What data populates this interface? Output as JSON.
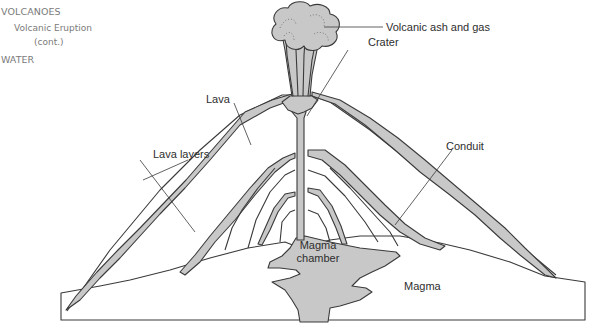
{
  "sidebar": {
    "section": "VOLCANOES",
    "subsection_line1": "Volcanic Eruption",
    "subsection_line2": "(cont.)",
    "next_section": "WATER"
  },
  "diagram": {
    "title": "Volcanic Eruption",
    "labels": {
      "ash": "Volcanic ash and gas",
      "crater": "Crater",
      "lava": "Lava",
      "conduit": "Conduit",
      "lava_layers": "Lava layers",
      "chamber_line1": "Magma",
      "chamber_line2": "chamber",
      "magma": "Magma"
    },
    "colors": {
      "fill": "#c8c8c8",
      "stroke": "#3a3a3a",
      "background": "#ffffff"
    }
  }
}
